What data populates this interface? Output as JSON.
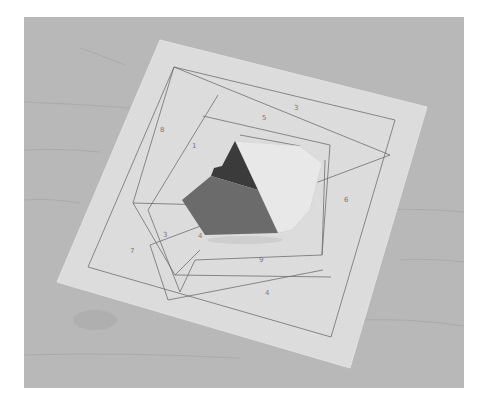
{
  "image": {
    "description": "Photo of a paper-pieced quilt block in progress lying on a wooden table",
    "frame": {
      "x": 24,
      "y": 17,
      "width": 440,
      "height": 371
    },
    "colors": {
      "background_border": "#ffffff",
      "wood": "#b7b7b7",
      "wood_grain": "#a4a4a4",
      "paper": "#dcdcdc",
      "pencil_line": "#6e6e6e",
      "fabric_dark": "#3a3a3a",
      "fabric_medium": "#6b6b6b",
      "fabric_light": "#e8e8e8"
    },
    "paper_labels": [
      "1",
      "2",
      "3",
      "4",
      "5",
      "6",
      "7",
      "8",
      "9",
      "10",
      "11",
      "12"
    ]
  }
}
